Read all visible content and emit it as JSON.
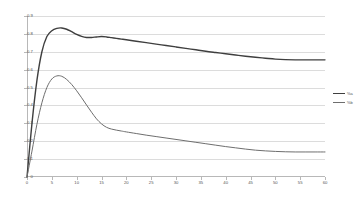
{
  "chart_data": {
    "type": "line",
    "title": "",
    "xlabel": "",
    "ylabel": "",
    "xlim": [
      0,
      60
    ],
    "ylim": [
      0,
      0.9
    ],
    "grid": "horizontal",
    "legend_position": "right",
    "x_ticks": [
      "0",
      "5",
      "10",
      "15",
      "20",
      "25",
      "30",
      "35",
      "40",
      "45",
      "50",
      "55",
      "60"
    ],
    "x_tick_values": [
      0,
      5,
      10,
      15,
      20,
      25,
      30,
      35,
      40,
      45,
      50,
      55,
      60
    ],
    "y_ticks": [
      "0",
      "0.1",
      "0.2",
      "0.3",
      "0.4",
      "0.5",
      "0.6",
      "0.7",
      "0.8",
      "0.9"
    ],
    "y_tick_values": [
      0,
      0.1,
      0.2,
      0.3,
      0.4,
      0.5,
      0.6,
      0.7,
      0.8,
      0.9
    ],
    "x": [
      0,
      1,
      2,
      3,
      4,
      5,
      6,
      7,
      8,
      9,
      10,
      11,
      12,
      13,
      14,
      15,
      16,
      17,
      18,
      19,
      20,
      22,
      24,
      26,
      28,
      30,
      32,
      34,
      36,
      38,
      40,
      42,
      44,
      46,
      48,
      50,
      52,
      54,
      56,
      58,
      60
    ],
    "series": [
      {
        "name": "%a",
        "color": "#3f3f3f",
        "width": 1.4,
        "values": [
          0.0,
          0.3,
          0.54,
          0.7,
          0.785,
          0.818,
          0.831,
          0.833,
          0.826,
          0.812,
          0.797,
          0.786,
          0.78,
          0.78,
          0.783,
          0.785,
          0.783,
          0.779,
          0.775,
          0.771,
          0.767,
          0.759,
          0.751,
          0.743,
          0.735,
          0.727,
          0.719,
          0.711,
          0.703,
          0.696,
          0.689,
          0.682,
          0.675,
          0.669,
          0.664,
          0.659,
          0.656,
          0.655,
          0.655,
          0.655,
          0.655
        ]
      },
      {
        "name": "%b",
        "color": "#6e6e6e",
        "width": 1.0,
        "values": [
          0.0,
          0.145,
          0.295,
          0.415,
          0.5,
          0.548,
          0.565,
          0.563,
          0.545,
          0.517,
          0.482,
          0.443,
          0.402,
          0.362,
          0.325,
          0.297,
          0.278,
          0.268,
          0.262,
          0.257,
          0.252,
          0.243,
          0.234,
          0.226,
          0.218,
          0.21,
          0.202,
          0.194,
          0.186,
          0.178,
          0.17,
          0.163,
          0.156,
          0.15,
          0.146,
          0.143,
          0.141,
          0.14,
          0.14,
          0.14,
          0.14
        ]
      }
    ]
  }
}
